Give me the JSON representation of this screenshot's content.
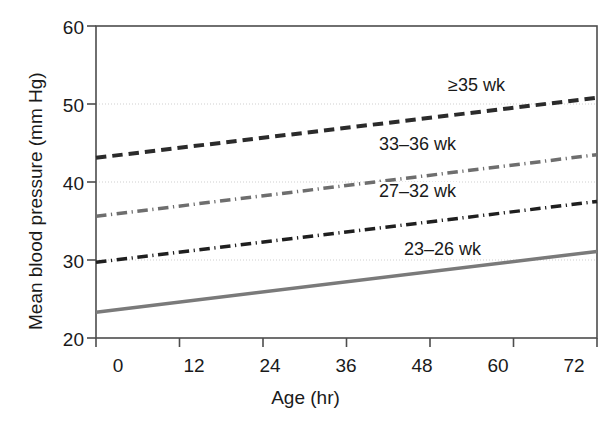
{
  "chart_data": {
    "type": "line",
    "title": "",
    "xlabel": "Age (hr)",
    "ylabel": "Mean blood pressure (mm Hg)",
    "xlim": [
      0,
      72
    ],
    "ylim": [
      20,
      60
    ],
    "xticks": [
      0,
      12,
      24,
      36,
      48,
      60,
      72
    ],
    "yticks": [
      20,
      30,
      40,
      50,
      60
    ],
    "xtick_labels": [
      "0",
      "12",
      "24",
      "36",
      "48",
      "60",
      "72"
    ],
    "ytick_labels": [
      "20",
      "30",
      "40",
      "50",
      "60"
    ],
    "grid": "horizontal-dotted-light",
    "legend_position": "inline-labels-right",
    "x": [
      0,
      72
    ],
    "series": [
      {
        "name": "≥35 wk",
        "label": "≥35 wk",
        "values": [
          43.1,
          50.8
        ],
        "color": "#2b2b2b",
        "style": "dashed",
        "width": 4,
        "label_x": 48,
        "label_y": 52.8
      },
      {
        "name": "33–36 wk",
        "label": "33–36 wk",
        "values": [
          35.6,
          43.5
        ],
        "color": "#6e6e6e",
        "style": "dash-dot",
        "width": 3.5,
        "label_x": 40,
        "label_y": 45.6
      },
      {
        "name": "27–32 wk",
        "label": "27–32 wk",
        "values": [
          29.7,
          37.5
        ],
        "color": "#1f1f1f",
        "style": "dash-dot",
        "width": 3.5,
        "label_x": 40,
        "label_y": 39.6
      },
      {
        "name": "23–26 wk",
        "label": "23–26 wk",
        "values": [
          23.3,
          31.1
        ],
        "color": "#7a7a7a",
        "style": "solid",
        "width": 3.5,
        "label_x": 44,
        "label_y": 33.3
      }
    ]
  },
  "axes": {
    "frame_color": "#4d4d4d",
    "grid_color": "#cfcfcf"
  }
}
